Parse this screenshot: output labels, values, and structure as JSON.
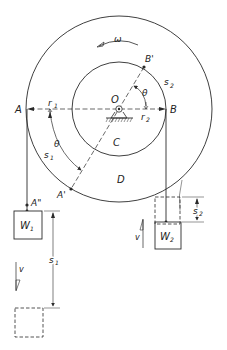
{
  "diagram": {
    "type": "mechanics-pulley-diagram",
    "labels": {
      "omega": "ω",
      "point_A": "A",
      "point_B": "B",
      "point_B_prime": "B'",
      "point_A_prime": "A'",
      "point_A_double_prime": "A\"",
      "center_O": "O",
      "inner_wheel_C": "C",
      "outer_wheel_D": "D",
      "radius_r1": "r",
      "radius_r1_sub": "1",
      "radius_r2": "r",
      "radius_r2_sub": "2",
      "theta_inner": "θ",
      "theta_outer": "θ",
      "arc_s1": "s",
      "arc_s1_sub": "1",
      "arc_s2": "s",
      "arc_s2_sub": "2",
      "weight_W1": "W",
      "weight_W1_sub": "1",
      "weight_W2": "W",
      "weight_W2_sub": "2",
      "disp_s1": "s",
      "disp_s1_sub": "1",
      "disp_s2": "s",
      "disp_s2_sub": "2",
      "velocity_left": "v",
      "velocity_right": "v"
    },
    "colors": {
      "stroke": "#2a2a2a",
      "background": "#ffffff"
    }
  }
}
